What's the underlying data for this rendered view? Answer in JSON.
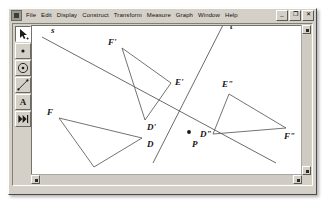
{
  "window": {
    "app_icon": "sketchpad-app-icon",
    "menus": [
      "File",
      "Edit",
      "Display",
      "Construct",
      "Transform",
      "Measure",
      "Graph",
      "Window",
      "Help"
    ],
    "controls": [
      {
        "name": "minimize-button",
        "glyph": "_"
      },
      {
        "name": "restore-button",
        "glyph": "❐"
      },
      {
        "name": "close-button",
        "glyph": "✕"
      }
    ]
  },
  "toolbar": {
    "tools": [
      {
        "name": "selection-arrow-tool",
        "icon": "arrow-icon",
        "selected": true
      },
      {
        "name": "point-tool",
        "icon": "point-icon",
        "selected": false
      },
      {
        "name": "compass-circle-tool",
        "icon": "circle-icon",
        "selected": false
      },
      {
        "name": "straightedge-tool",
        "icon": "line-icon",
        "selected": false
      },
      {
        "name": "text-tool",
        "icon": "letter-a-icon",
        "label": "A",
        "selected": false
      },
      {
        "name": "custom-tool",
        "icon": "custom-tool-icon",
        "selected": false
      }
    ]
  },
  "scrollbars": {
    "vertical": {
      "up": "▲",
      "down": "▼"
    },
    "horizontal": {
      "left": "◄",
      "right": "►"
    }
  },
  "sketch": {
    "lines": [
      {
        "name": "line-s",
        "label": "s",
        "label_x": 37,
        "label_y": 22,
        "x1": 28,
        "y1": 26,
        "x2": 262,
        "y2": 152
      },
      {
        "name": "line-t",
        "label": "t",
        "label_x": 216,
        "label_y": 18,
        "x1": 209,
        "y1": 14,
        "x2": 139,
        "y2": 152
      }
    ],
    "points": [
      {
        "name": "point-p",
        "label": "P",
        "x": 175,
        "y": 121,
        "label_x": 178,
        "label_y": 136
      }
    ],
    "triangles": [
      {
        "name": "triangle-fde",
        "vertices": [
          {
            "label": "F",
            "x": 45,
            "y": 107,
            "label_x": 33,
            "label_y": 104
          },
          {
            "label": "D",
            "x": 128,
            "y": 127,
            "label_x": 133,
            "label_y": 136
          },
          {
            "label": "E",
            "x": 80,
            "y": 156,
            "label_x": 74,
            "label_y": 170
          }
        ]
      },
      {
        "name": "triangle-f-prime-e-prime-d-prime",
        "vertices": [
          {
            "label": "F'",
            "x": 108,
            "y": 37,
            "label_x": 94,
            "label_y": 34
          },
          {
            "label": "E'",
            "x": 157,
            "y": 72,
            "label_x": 161,
            "label_y": 74
          },
          {
            "label": "D'",
            "x": 131,
            "y": 109,
            "label_x": 133,
            "label_y": 119
          }
        ]
      },
      {
        "name": "triangle-e-double-prime-f-double-prime-d-double-prime",
        "vertices": [
          {
            "label": "E\"",
            "x": 215,
            "y": 83,
            "label_x": 208,
            "label_y": 76
          },
          {
            "label": "F\"",
            "x": 272,
            "y": 117,
            "label_x": 270,
            "label_y": 128
          },
          {
            "label": "D\"",
            "x": 199,
            "y": 123,
            "label_x": 186,
            "label_y": 126
          }
        ]
      }
    ]
  }
}
